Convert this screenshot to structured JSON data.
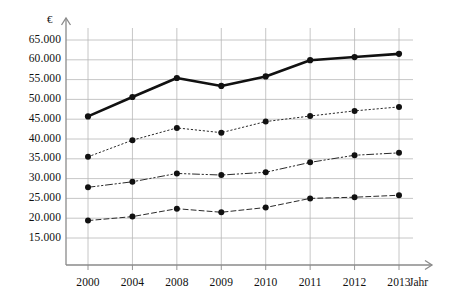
{
  "chart_data": {
    "type": "line",
    "title": "",
    "subtitle": "",
    "xlabel": "Jahr",
    "ylabel": "€",
    "categories": [
      "2000",
      "2004",
      "2008",
      "2009",
      "2010",
      "2011",
      "2012",
      "2013"
    ],
    "ylim": [
      10000,
      67000
    ],
    "yticks": [
      15000,
      20000,
      25000,
      30000,
      35000,
      40000,
      45000,
      50000,
      55000,
      60000,
      65000
    ],
    "ytick_labels": [
      "15.000",
      "20.000",
      "25.000",
      "30.000",
      "35.000",
      "40.000",
      "45.000",
      "50.000",
      "55.000",
      "60.000",
      "65.000"
    ],
    "grid": true,
    "legend": "none",
    "series": [
      {
        "name": "series-1-solid",
        "style": "solid",
        "color": "#111111",
        "width": 2.6,
        "marker": "filled-circle",
        "values": [
          45700,
          50600,
          55400,
          53400,
          55800,
          59900,
          60700,
          61500
        ]
      },
      {
        "name": "series-2-dotted",
        "style": "dotted",
        "color": "#2a2a2a",
        "width": 1.0,
        "marker": "filled-circle",
        "values": [
          35500,
          39700,
          42800,
          41600,
          44400,
          45800,
          47100,
          48100
        ]
      },
      {
        "name": "series-3-dash-dot",
        "style": "dash-dot",
        "color": "#2a2a2a",
        "width": 1.0,
        "marker": "filled-circle",
        "values": [
          27800,
          29200,
          31300,
          30900,
          31600,
          34100,
          35900,
          36500
        ]
      },
      {
        "name": "series-4-dashed",
        "style": "dashed",
        "color": "#2a2a2a",
        "width": 1.0,
        "marker": "filled-circle",
        "values": [
          19400,
          20400,
          22400,
          21500,
          22700,
          25000,
          25300,
          25800
        ]
      }
    ]
  },
  "axes": {
    "y_unit": "€",
    "x_title": "Jahr",
    "axis_color": "#8a8a8a",
    "grid_color": "#b8b8b8",
    "text_color": "#111111"
  }
}
